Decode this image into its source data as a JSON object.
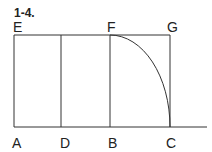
{
  "figure": {
    "number": "1-4.",
    "points": {
      "A": "A",
      "D": "D",
      "B": "B",
      "C": "C",
      "E": "E",
      "F": "F",
      "G": "G"
    }
  }
}
